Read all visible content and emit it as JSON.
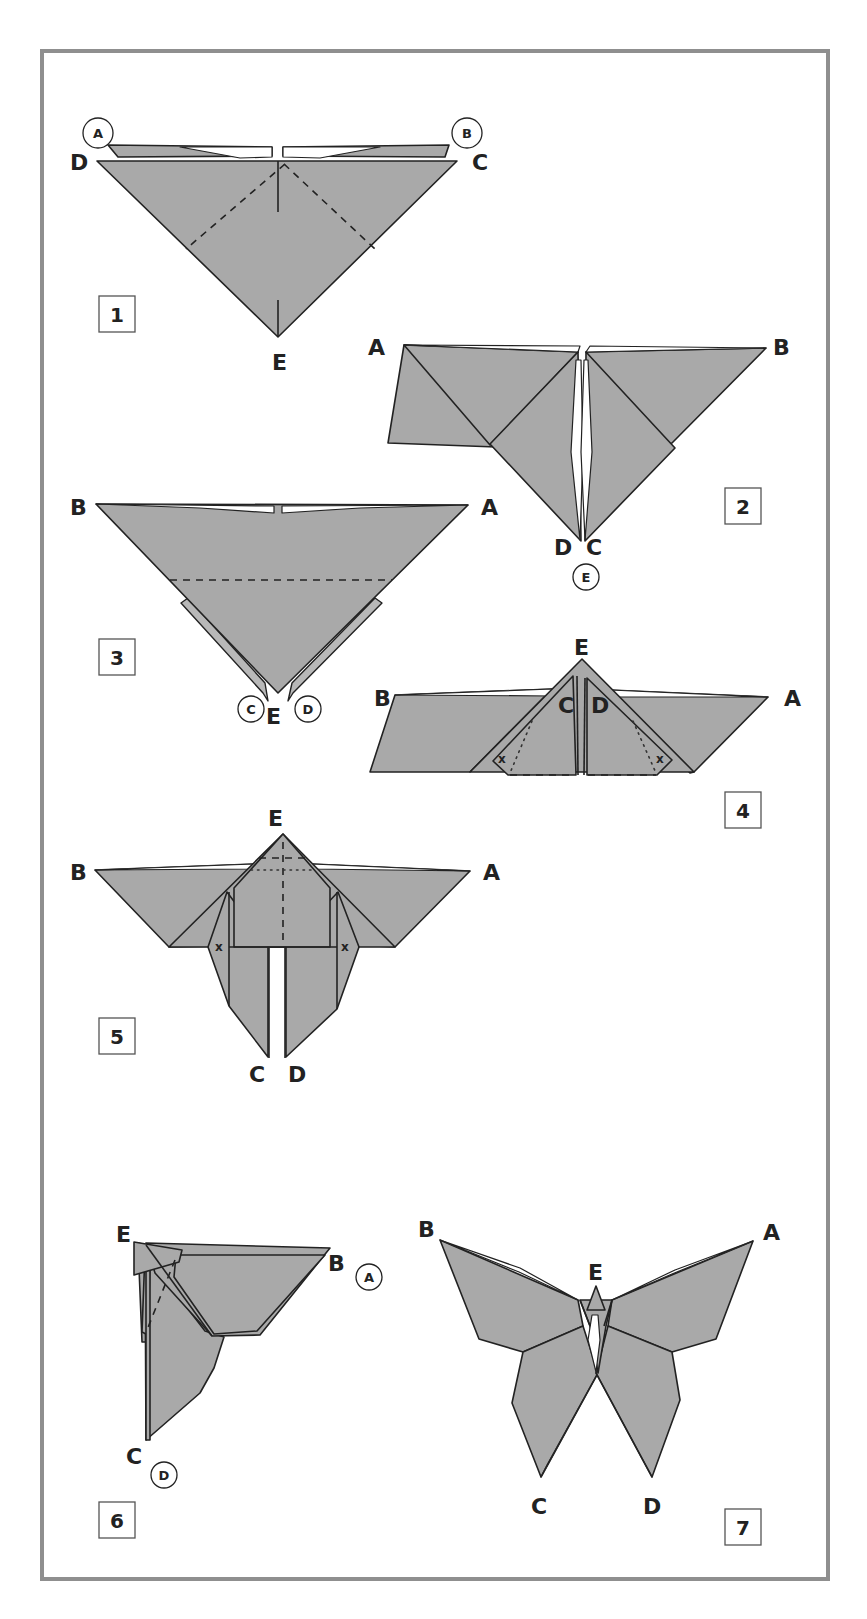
{
  "diagram": {
    "colors": {
      "paper": "#a9a9a9",
      "frame": "#8f8f8f",
      "line": "#222222",
      "background": "#ffffff"
    },
    "steps": [
      {
        "number": "1",
        "labels": {
          "A": "A",
          "B": "B",
          "C": "C",
          "D": "D",
          "E": "E"
        },
        "circled": [
          "A",
          "B"
        ]
      },
      {
        "number": "2",
        "labels": {
          "A": "A",
          "B": "B",
          "C": "C",
          "D": "D",
          "E": "E"
        },
        "circled": [
          "E"
        ]
      },
      {
        "number": "3",
        "labels": {
          "A": "A",
          "B": "B",
          "C": "C",
          "D": "D",
          "E": "E"
        },
        "circled": [
          "C",
          "D"
        ]
      },
      {
        "number": "4",
        "labels": {
          "A": "A",
          "B": "B",
          "C": "C",
          "D": "D",
          "E": "E"
        },
        "marks": [
          "x",
          "x"
        ]
      },
      {
        "number": "5",
        "labels": {
          "A": "A",
          "B": "B",
          "C": "C",
          "D": "D",
          "E": "E"
        },
        "marks": [
          "x",
          "x"
        ]
      },
      {
        "number": "6",
        "labels": {
          "A": "A",
          "B": "B",
          "C": "C",
          "D": "D",
          "E": "E"
        },
        "circled": [
          "A",
          "D"
        ]
      },
      {
        "number": "7",
        "labels": {
          "A": "A",
          "B": "B",
          "C": "C",
          "D": "D",
          "E": "E"
        }
      }
    ]
  }
}
